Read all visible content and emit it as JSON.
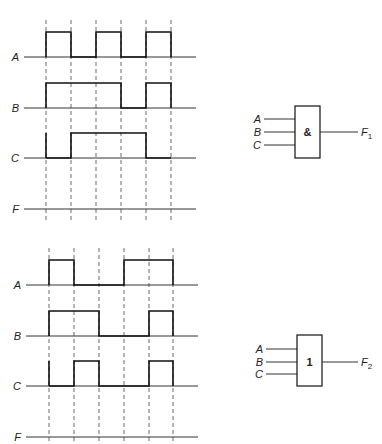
{
  "figure": {
    "sections": [
      {
        "id": "and",
        "grid_x": [
          46,
          71,
          96,
          121,
          146,
          171
        ],
        "grid_y_top": 20,
        "grid_y_bottom": 222,
        "baseline_x_start": 24,
        "baseline_x_end": 196,
        "high_offset": 25,
        "signals": [
          {
            "label": "A",
            "baseline_y": 57,
            "levels": [
              1,
              0,
              1,
              0,
              1
            ]
          },
          {
            "label": "B",
            "baseline_y": 108,
            "levels": [
              1,
              1,
              1,
              0,
              1
            ]
          },
          {
            "label": "C",
            "baseline_y": 158,
            "levels": [
              0,
              1,
              1,
              1,
              0
            ]
          },
          {
            "label": "F",
            "baseline_y": 209,
            "levels": null
          }
        ],
        "gate": {
          "symbol": "&",
          "inputs": [
            "A",
            "B",
            "C"
          ],
          "output": "F",
          "output_subscript": "1",
          "box": {
            "x": 295,
            "y": 106,
            "w": 25,
            "h": 52
          },
          "input_y": [
            119,
            132,
            145
          ],
          "output_y": 132
        }
      },
      {
        "id": "or",
        "grid_x": [
          49,
          74,
          99,
          124,
          149,
          173
        ],
        "grid_y_top": 248,
        "grid_y_bottom": 444,
        "baseline_x_start": 26,
        "baseline_x_end": 198,
        "high_offset": 25,
        "signals": [
          {
            "label": "A",
            "baseline_y": 285,
            "levels": [
              1,
              0,
              0,
              1,
              1
            ]
          },
          {
            "label": "B",
            "baseline_y": 336,
            "levels": [
              1,
              1,
              0,
              0,
              1
            ]
          },
          {
            "label": "C",
            "baseline_y": 386,
            "levels": [
              0,
              1,
              0,
              0,
              1
            ]
          },
          {
            "label": "F",
            "baseline_y": 437,
            "levels": null
          }
        ],
        "gate": {
          "symbol": "1",
          "inputs": [
            "A",
            "B",
            "C"
          ],
          "output": "F",
          "output_subscript": "2",
          "box": {
            "x": 297,
            "y": 335,
            "w": 25,
            "h": 51
          },
          "input_y": [
            349,
            362,
            374
          ],
          "output_y": 362
        }
      }
    ]
  }
}
